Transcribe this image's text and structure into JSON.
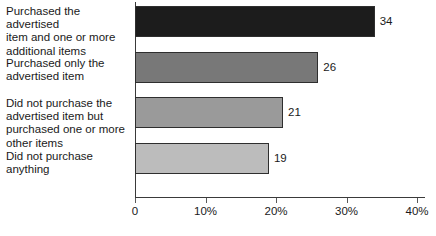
{
  "chart_data": {
    "type": "bar",
    "orientation": "horizontal",
    "title": "",
    "subtitle": "",
    "xlabel": "",
    "ylabel": "",
    "categories": [
      "Purchased the advertised item and one or more additional items",
      "Purchased only the advertised item",
      "Did not purchase the advertised item but purchased one or more other items",
      "Did not purchase anything"
    ],
    "values": [
      34,
      26,
      21,
      19
    ],
    "value_labels": [
      "34",
      "26",
      "21",
      "19"
    ],
    "bar_colors": [
      "#1c1c1c",
      "#787878",
      "#9a9a9a",
      "#bcbcbc"
    ],
    "bar_border_color": "#2e2e2e",
    "axis_color": "#3a3a3a",
    "xlim": [
      0,
      40
    ],
    "xticks": [
      0,
      10,
      20,
      30,
      40
    ],
    "xtick_labels": [
      "0",
      "10%",
      "20%",
      "30%",
      "40%"
    ],
    "grid": false,
    "legend": false
  },
  "category_label_lines": [
    [
      "Purchased the advertised",
      "item and one or more",
      "additional items"
    ],
    [
      "Purchased only the",
      "advertised item"
    ],
    [
      "Did not purchase the",
      "advertised item but",
      "purchased one or more",
      "other items"
    ],
    [
      "Did not purchase",
      "anything"
    ]
  ]
}
